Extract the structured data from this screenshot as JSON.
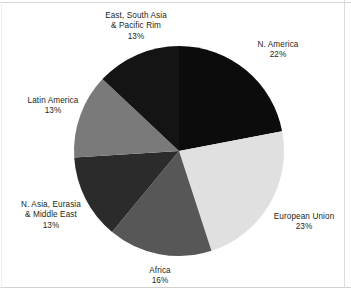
{
  "chart_data": {
    "type": "pie",
    "title": "",
    "subtitle": "",
    "legend_position": "around-slices",
    "grid": false,
    "start_angle_deg": 0,
    "direction": "clockwise",
    "units": "percent",
    "categories": [
      "N. America",
      "European Union",
      "Africa",
      "N. Asia, Eurasia & Middle East",
      "Latin America",
      "East, South Asia & Pacific Rim"
    ],
    "values": [
      22,
      23,
      16,
      13,
      13,
      13
    ],
    "total": 100,
    "slices": [
      {
        "id": "n-america",
        "name": "N. America",
        "label_lines": [
          "N. America"
        ],
        "value": 22,
        "percent_text": "22%",
        "color": "#0c0c0c"
      },
      {
        "id": "european-union",
        "name": "European Union",
        "label_lines": [
          "European Union"
        ],
        "value": 23,
        "percent_text": "23%",
        "color": "#e0e0e0"
      },
      {
        "id": "africa",
        "name": "Africa",
        "label_lines": [
          "Africa"
        ],
        "value": 16,
        "percent_text": "16%",
        "color": "#575757"
      },
      {
        "id": "n-asia-eurasia",
        "name": "N. Asia, Eurasia & Middle East",
        "label_lines": [
          "N. Asia, Eurasia",
          "& Middle East"
        ],
        "value": 13,
        "percent_text": "13%",
        "color": "#2b2b2b"
      },
      {
        "id": "latin-america",
        "name": "Latin America",
        "label_lines": [
          "Latin America"
        ],
        "value": 13,
        "percent_text": "13%",
        "color": "#7a7a7a"
      },
      {
        "id": "east-south-asia",
        "name": "East, South Asia & Pacific Rim",
        "label_lines": [
          "East, South Asia",
          "& Pacific Rim"
        ],
        "value": 13,
        "percent_text": "13%",
        "color": "#141414"
      }
    ],
    "geometry": {
      "center_x": 179,
      "center_y": 151,
      "radius": 105
    },
    "background_color": "#ffffff",
    "text_color": "#231f20"
  },
  "labels": {
    "n_america": {
      "line1": "N. America",
      "percent": "22%"
    },
    "european_union": {
      "line1": "European Union",
      "percent": "23%"
    },
    "africa": {
      "line1": "Africa",
      "percent": "16%"
    },
    "n_asia_eurasia": {
      "line1": "N. Asia, Eurasia",
      "line2": "& Middle East",
      "percent": "13%"
    },
    "latin_america": {
      "line1": "Latin America",
      "percent": "13%"
    },
    "east_south_asia": {
      "line1": "East, South Asia",
      "line2": "& Pacific Rim",
      "percent": "13%"
    }
  }
}
